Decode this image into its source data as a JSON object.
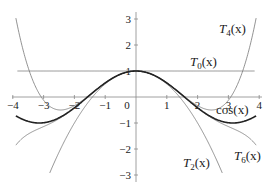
{
  "chart_data": {
    "type": "line",
    "title": "",
    "xlabel": "",
    "ylabel": "",
    "xlim": [
      -4,
      4
    ],
    "ylim": [
      -3.3,
      3.3
    ],
    "grid": false,
    "legend": "inline labels",
    "x_ticks": [
      "-4",
      "-3",
      "-2",
      "-1",
      "0",
      "1",
      "2",
      "3",
      "4"
    ],
    "y_ticks": [
      "3",
      "2",
      "1",
      "-1",
      "-2",
      "-3"
    ],
    "series": [
      {
        "name": "cos(x)",
        "expr": "cos(x)",
        "style": "thick dark"
      },
      {
        "name": "T0(x)",
        "expr": "1",
        "style": "thin gray"
      },
      {
        "name": "T2(x)",
        "expr": "1 - x^2/2",
        "style": "thin gray"
      },
      {
        "name": "T4(x)",
        "expr": "1 - x^2/2 + x^4/24",
        "style": "thin gray"
      },
      {
        "name": "T6(x)",
        "expr": "1 - x^2/2 + x^4/24 - x^6/720",
        "style": "thin gray"
      }
    ],
    "labels": {
      "cos": {
        "text": "cos(x)"
      },
      "T0": {
        "base": "T",
        "sub": "0",
        "arg": "(x)"
      },
      "T2": {
        "base": "T",
        "sub": "2",
        "arg": "(x)"
      },
      "T4": {
        "base": "T",
        "sub": "4",
        "arg": "(x)"
      },
      "T6": {
        "base": "T",
        "sub": "6",
        "arg": "(x)"
      }
    }
  }
}
